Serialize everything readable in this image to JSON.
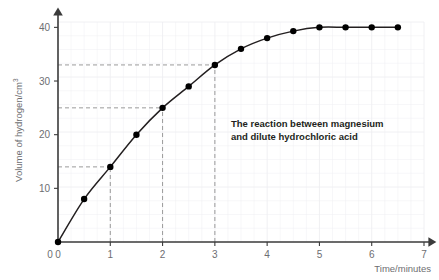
{
  "chart_data": {
    "type": "line",
    "title": "",
    "annotation": {
      "line1": "The reaction between magnesium",
      "line2": "and dilute hydrochloric acid"
    },
    "xlabel": "Time/minutes",
    "ylabel_main": "Volume of hydrogen/cm",
    "ylabel_sup": "3",
    "xlim": [
      0,
      7
    ],
    "ylim": [
      0,
      41
    ],
    "xticks": [
      "0",
      "1",
      "2",
      "3",
      "4",
      "5",
      "6",
      "7"
    ],
    "xtick_values": [
      0,
      1,
      2,
      3,
      4,
      5,
      6,
      7
    ],
    "yticks": [
      "10",
      "20",
      "30",
      "40"
    ],
    "ytick_values": [
      10,
      20,
      30,
      40
    ],
    "grid": true,
    "legend": "none",
    "x": [
      0,
      0.5,
      1,
      1.5,
      2,
      2.5,
      3,
      3.5,
      4,
      4.5,
      5,
      5.5,
      6,
      6.5
    ],
    "values": [
      0,
      8,
      14,
      20,
      25,
      29,
      33,
      36,
      38,
      39.3,
      40,
      40,
      40,
      40
    ],
    "marker": "filled-circle",
    "marker_color": "#000000",
    "line_color": "#231f20",
    "guide_lines": [
      {
        "kind": "horizontal",
        "y": 14,
        "x_from": 0,
        "x_to": 1
      },
      {
        "kind": "vertical",
        "x": 1,
        "y_from": 0,
        "y_to": 14
      },
      {
        "kind": "horizontal",
        "y": 25,
        "x_from": 0,
        "x_to": 2
      },
      {
        "kind": "vertical",
        "x": 2,
        "y_from": 0,
        "y_to": 25
      },
      {
        "kind": "horizontal",
        "y": 33,
        "x_from": 0,
        "x_to": 3
      },
      {
        "kind": "vertical",
        "x": 3,
        "y_from": 0,
        "y_to": 33
      }
    ],
    "guide_color": "#9a9a9a",
    "grid_color": "#eeeef2",
    "axis_color": "#3b3b3b"
  }
}
